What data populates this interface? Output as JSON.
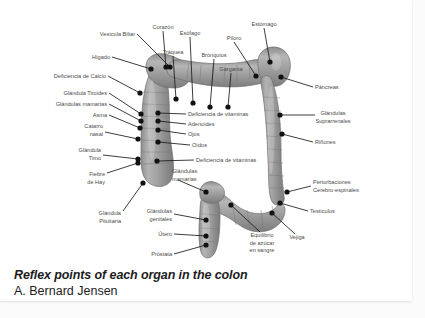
{
  "document": {
    "caption_title": "Reflex points of each organ in the colon",
    "caption_author": "A. Bernard Jensen",
    "background_color": "#ffffff",
    "page_color": "#e9e9e9"
  },
  "diagram": {
    "type": "anatomical-diagram",
    "subject": "colon",
    "illustration_color": "#9a9a9a",
    "marker_color": "#111111",
    "leader_color": "#1a1a1a",
    "label_color": "#4a4a4a",
    "labels": [
      {
        "id": "vesicula-biliar",
        "text": "Vesícula Biliar",
        "lines": [
          "Vesícula Biliar"
        ],
        "anchor": "end",
        "tx": 135,
        "ty": 36,
        "lx": 137,
        "ly": 34,
        "dx": 170,
        "dy": 67
      },
      {
        "id": "corazon",
        "text": "Corazón",
        "lines": [
          "Corazón"
        ],
        "anchor": "middle",
        "tx": 163,
        "ty": 29,
        "lx": 163,
        "ly": 31,
        "dx": 166,
        "dy": 67
      },
      {
        "id": "esofago",
        "text": "Esófago",
        "lines": [
          "Esófago"
        ],
        "anchor": "middle",
        "tx": 190,
        "ty": 35,
        "lx": 190,
        "ly": 37,
        "dx": 193,
        "dy": 103
      },
      {
        "id": "traquea",
        "text": "Tráquea",
        "lines": [
          "Tráquea"
        ],
        "anchor": "middle",
        "tx": 173,
        "ty": 54,
        "lx": 173,
        "ly": 56,
        "dx": 176,
        "dy": 99
      },
      {
        "id": "bronquios",
        "text": "Brónquios",
        "lines": [
          "Brónquios"
        ],
        "anchor": "middle",
        "tx": 214,
        "ty": 57,
        "lx": 214,
        "ly": 59,
        "dx": 210,
        "dy": 107
      },
      {
        "id": "piloro",
        "text": "Píloro",
        "lines": [
          "Píloro"
        ],
        "anchor": "middle",
        "tx": 234,
        "ty": 40,
        "lx": 234,
        "ly": 42,
        "dx": 256,
        "dy": 76
      },
      {
        "id": "garganta",
        "text": "Garganta",
        "lines": [
          "Garganta"
        ],
        "anchor": "middle",
        "tx": 231,
        "ty": 71,
        "lx": 231,
        "ly": 73,
        "dx": 228,
        "dy": 107
      },
      {
        "id": "estomago",
        "text": "Estómago",
        "lines": [
          "Estómago"
        ],
        "anchor": "middle",
        "tx": 264,
        "ty": 26,
        "lx": 264,
        "ly": 28,
        "dx": 270,
        "dy": 62
      },
      {
        "id": "higado",
        "text": "Hígado",
        "lines": [
          "Hígado"
        ],
        "anchor": "end",
        "tx": 110,
        "ty": 59,
        "lx": 112,
        "ly": 57,
        "dx": 151,
        "dy": 69
      },
      {
        "id": "deficiencia-calcio",
        "text": "Deficiencia de Calcio",
        "lines": [
          "Deficiencia de Calcio"
        ],
        "anchor": "end",
        "tx": 106,
        "ty": 78,
        "lx": 108,
        "ly": 76,
        "dx": 140,
        "dy": 93
      },
      {
        "id": "glandula-tiroides",
        "text": "Glándula Tiroides",
        "lines": [
          "Glándula Tiroides"
        ],
        "anchor": "end",
        "tx": 107,
        "ty": 95,
        "lx": 109,
        "ly": 93,
        "dx": 141,
        "dy": 114
      },
      {
        "id": "glandulas-mamarias",
        "text": "Glándulas mamarias",
        "lines": [
          "Glándulas mamarias"
        ],
        "anchor": "end",
        "tx": 107,
        "ty": 106,
        "lx": 109,
        "ly": 104,
        "dx": 141,
        "dy": 121
      },
      {
        "id": "asma",
        "text": "Asma",
        "lines": [
          "Asma"
        ],
        "anchor": "end",
        "tx": 107,
        "ty": 117,
        "lx": 109,
        "ly": 115,
        "dx": 140,
        "dy": 128
      },
      {
        "id": "catarro-nasal",
        "text": "Catarro nasal",
        "lines": [
          "Catarro",
          "nasal"
        ],
        "anchor": "end",
        "tx": 103,
        "ty": 128,
        "lx": 105,
        "ly": 132,
        "dx": 138,
        "dy": 139
      },
      {
        "id": "glandula-timo",
        "text": "Glándula Timo",
        "lines": [
          "Glándula",
          "Timo"
        ],
        "anchor": "end",
        "tx": 101,
        "ty": 152,
        "lx": 103,
        "ly": 155,
        "dx": 138,
        "dy": 159
      },
      {
        "id": "fiebre-de-hay",
        "text": "Fiebre de Hay",
        "lines": [
          "Fiebre",
          "de Hay"
        ],
        "anchor": "end",
        "tx": 105,
        "ty": 176,
        "lx": 107,
        "ly": 173,
        "dx": 138,
        "dy": 163
      },
      {
        "id": "glandula-pituitaria",
        "text": "Glándula Pituitaria",
        "lines": [
          "Glándula",
          "Pituitaria"
        ],
        "anchor": "end",
        "tx": 121,
        "ty": 215,
        "lx": 123,
        "ly": 211,
        "dx": 143,
        "dy": 183
      },
      {
        "id": "deficiencia-vitaminas-1",
        "text": "Deficiencia de vitaminas",
        "lines": [
          "Deficiencia de vitaminas"
        ],
        "anchor": "start",
        "tx": 188,
        "ty": 116,
        "lx": 186,
        "ly": 114,
        "dx": 158,
        "dy": 113
      },
      {
        "id": "adenoides",
        "text": "Adenoides",
        "lines": [
          "Adenoides"
        ],
        "anchor": "start",
        "tx": 188,
        "ty": 126,
        "lx": 186,
        "ly": 124,
        "dx": 158,
        "dy": 121
      },
      {
        "id": "ojos",
        "text": "Ojos",
        "lines": [
          "Ojos"
        ],
        "anchor": "start",
        "tx": 188,
        "ty": 136,
        "lx": 186,
        "ly": 134,
        "dx": 158,
        "dy": 130
      },
      {
        "id": "oidos",
        "text": "Oídos",
        "lines": [
          "Oídos"
        ],
        "anchor": "start",
        "tx": 192,
        "ty": 147,
        "lx": 190,
        "ly": 145,
        "dx": 158,
        "dy": 142
      },
      {
        "id": "deficiencia-vitaminas-2",
        "text": "Deficiencia de vitaminas",
        "lines": [
          "Deficiencia de vitaminas"
        ],
        "anchor": "start",
        "tx": 196,
        "ty": 162,
        "lx": 194,
        "ly": 160,
        "dx": 157,
        "dy": 161
      },
      {
        "id": "glandulas-mamarias-2",
        "text": "Glándulas mamarias",
        "lines": [
          "Glándulas",
          "mamarias"
        ],
        "anchor": "start",
        "tx": 172,
        "ty": 173,
        "lx": 178,
        "ly": 180,
        "dx": 206,
        "dy": 192
      },
      {
        "id": "glandulas-genitales",
        "text": "Glándulas genitales",
        "lines": [
          "Glándulas",
          "genitales"
        ],
        "anchor": "end",
        "tx": 172,
        "ty": 213,
        "lx": 174,
        "ly": 214,
        "dx": 206,
        "dy": 220
      },
      {
        "id": "utero",
        "text": "Útero",
        "lines": [
          "Útero"
        ],
        "anchor": "end",
        "tx": 172,
        "ty": 236,
        "lx": 174,
        "ly": 234,
        "dx": 206,
        "dy": 236
      },
      {
        "id": "prostata",
        "text": "Próstata",
        "lines": [
          "Próstata"
        ],
        "anchor": "end",
        "tx": 172,
        "ty": 256,
        "lx": 174,
        "ly": 254,
        "dx": 206,
        "dy": 245
      },
      {
        "id": "equilibrio-azucar",
        "text": "Equilibrio de azúcar en sangre",
        "lines": [
          "Equilibrio",
          "de azúcar",
          "en sangre"
        ],
        "anchor": "middle",
        "tx": 262,
        "ty": 237,
        "lx": 260,
        "ly": 232,
        "dx": 231,
        "dy": 205
      },
      {
        "id": "pancreas",
        "text": "Páncreas",
        "lines": [
          "Páncreas"
        ],
        "anchor": "start",
        "tx": 315,
        "ty": 89,
        "lx": 313,
        "ly": 87,
        "dx": 281,
        "dy": 77
      },
      {
        "id": "glandulas-suprarrenales",
        "text": "Glándulas Suprarrenales",
        "lines": [
          "Glándulas",
          "Suprarrenales"
        ],
        "anchor": "middle",
        "tx": 333,
        "ty": 115,
        "lx": 315,
        "ly": 115,
        "dx": 280,
        "dy": 115
      },
      {
        "id": "rinones",
        "text": "Riñones",
        "lines": [
          "Riñones"
        ],
        "anchor": "start",
        "tx": 315,
        "ty": 144,
        "lx": 313,
        "ly": 142,
        "dx": 282,
        "dy": 134
      },
      {
        "id": "perturbaciones",
        "text": "Perturbaciones Cerebro-espinales",
        "lines": [
          "Perturbaciones",
          "Cerebro-espinales"
        ],
        "anchor": "start",
        "tx": 313,
        "ty": 184,
        "lx": 311,
        "ly": 186,
        "dx": 287,
        "dy": 192
      },
      {
        "id": "testiculos",
        "text": "Testículos",
        "lines": [
          "Testículos"
        ],
        "anchor": "start",
        "tx": 310,
        "ty": 213,
        "lx": 308,
        "ly": 211,
        "dx": 280,
        "dy": 203
      },
      {
        "id": "vejiga",
        "text": "Vejiga",
        "lines": [
          "Vejiga"
        ],
        "anchor": "middle",
        "tx": 297,
        "ty": 239,
        "lx": 295,
        "ly": 234,
        "dx": 272,
        "dy": 213
      }
    ]
  }
}
